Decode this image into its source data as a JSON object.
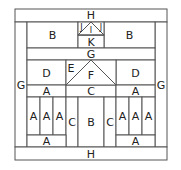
{
  "diagram": {
    "pieces": [
      {
        "id": "h_top",
        "label": "H",
        "x": 15,
        "y": 9,
        "w": 152,
        "h": 13
      },
      {
        "id": "g_left",
        "label": "G",
        "x": 15,
        "y": 22,
        "w": 12,
        "h": 125
      },
      {
        "id": "g_right",
        "label": "G",
        "x": 155,
        "y": 22,
        "w": 12,
        "h": 125
      },
      {
        "id": "b_left",
        "label": "B",
        "x": 27,
        "y": 22,
        "w": 51,
        "h": 26
      },
      {
        "id": "b_right",
        "label": "B",
        "x": 104,
        "y": 22,
        "w": 51,
        "h": 26
      },
      {
        "id": "k",
        "label": "K",
        "x": 78,
        "y": 35,
        "w": 26,
        "h": 13
      },
      {
        "id": "g_mid",
        "label": "G",
        "x": 27,
        "y": 48,
        "w": 128,
        "h": 12
      },
      {
        "id": "d_left",
        "label": "D",
        "x": 27,
        "y": 60,
        "w": 39,
        "h": 25
      },
      {
        "id": "d_right",
        "label": "D",
        "x": 116,
        "y": 60,
        "w": 39,
        "h": 25
      },
      {
        "id": "a_left_band",
        "label": "A",
        "x": 27,
        "y": 85,
        "w": 39,
        "h": 12
      },
      {
        "id": "c_mid_band",
        "label": "C",
        "x": 66,
        "y": 85,
        "w": 50,
        "h": 12
      },
      {
        "id": "a_right_band",
        "label": "A",
        "x": 116,
        "y": 85,
        "w": 39,
        "h": 12
      },
      {
        "id": "a_l1",
        "label": "A",
        "x": 27,
        "y": 97,
        "w": 13,
        "h": 38
      },
      {
        "id": "a_l2",
        "label": "A",
        "x": 40,
        "y": 97,
        "w": 13,
        "h": 38
      },
      {
        "id": "a_l3",
        "label": "A",
        "x": 53,
        "y": 97,
        "w": 13,
        "h": 38
      },
      {
        "id": "c_left",
        "label": "C",
        "x": 66,
        "y": 97,
        "w": 12,
        "h": 50
      },
      {
        "id": "b_center",
        "label": "B",
        "x": 78,
        "y": 97,
        "w": 26,
        "h": 50
      },
      {
        "id": "c_right",
        "label": "C",
        "x": 104,
        "y": 97,
        "w": 12,
        "h": 50
      },
      {
        "id": "a_r1",
        "label": "A",
        "x": 116,
        "y": 97,
        "w": 13,
        "h": 38
      },
      {
        "id": "a_r2",
        "label": "A",
        "x": 129,
        "y": 97,
        "w": 13,
        "h": 38
      },
      {
        "id": "a_r3",
        "label": "A",
        "x": 142,
        "y": 97,
        "w": 13,
        "h": 38
      },
      {
        "id": "a_left_bottom",
        "label": "A",
        "x": 27,
        "y": 135,
        "w": 39,
        "h": 12
      },
      {
        "id": "a_right_bottom",
        "label": "A",
        "x": 116,
        "y": 135,
        "w": 39,
        "h": 12
      },
      {
        "id": "h_bottom",
        "label": "H",
        "x": 15,
        "y": 147,
        "w": 152,
        "h": 13
      }
    ],
    "triangle_labels": {
      "h_top_label": "H",
      "i": "I",
      "j_left": "J",
      "j_right": "J",
      "g_mid_label": "G",
      "e": "E",
      "f": "F"
    }
  }
}
